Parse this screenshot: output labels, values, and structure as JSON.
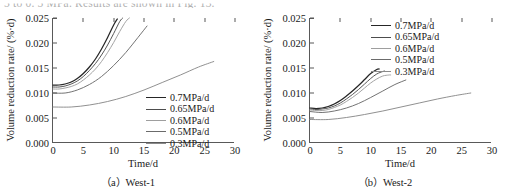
{
  "running_text": "5 to 0. 5 MPa.  Results are shown in Fig.  13.",
  "series_styles": {
    "0.7MPa/d": "#262626",
    "0.65MPa/d": "#4d4d4d",
    "0.6MPa/d": "#9e9e9e",
    "0.5MPa/d": "#6b6b6b",
    "0.3MPa/d": "#8a8a8a"
  },
  "figures": [
    {
      "id": "west-1",
      "caption": "（a）West-1",
      "xlabel": "Time/d",
      "ylabel": "Volume reduction rate/ (%·d)",
      "legend_position": "inside-lower-right"
    },
    {
      "id": "west-2",
      "caption": "（b）West-2",
      "xlabel": "Time/d",
      "ylabel": "Volume reduction rate/ (%·d)",
      "legend_position": "inside-upper-right"
    }
  ],
  "chart_data": [
    {
      "type": "line",
      "title": "（a）West-1",
      "xlabel": "Time/d",
      "ylabel": "Volume reduction rate/ (%·d)",
      "xlim": [
        0,
        30
      ],
      "ylim": [
        0.0,
        0.025
      ],
      "xticks": [
        0,
        5,
        10,
        15,
        20,
        25,
        30
      ],
      "yticks": [
        0.0,
        0.005,
        0.01,
        0.015,
        0.02,
        0.025
      ],
      "ytick_labels": [
        "0.000",
        "0.005",
        "0.010",
        "0.015",
        "0.020",
        "0.025"
      ],
      "xtick_labels": [
        "0",
        "5",
        "10",
        "15",
        "20",
        "25",
        "30"
      ],
      "grid": false,
      "legend_position": "lower right (inside)",
      "series": [
        {
          "name": "0.7MPa/d",
          "color": "#262626",
          "x": [
            0,
            1,
            2,
            3,
            4,
            5,
            6,
            7,
            8,
            9,
            10,
            10.6
          ],
          "y": [
            0.0116,
            0.0116,
            0.0118,
            0.0122,
            0.0129,
            0.0139,
            0.0152,
            0.0168,
            0.0188,
            0.0211,
            0.0236,
            0.0248
          ]
        },
        {
          "name": "0.65MPa/d",
          "color": "#4d4d4d",
          "x": [
            0,
            1,
            2,
            3,
            4,
            5,
            6,
            7,
            8,
            9,
            10,
            11,
            11.5
          ],
          "y": [
            0.0112,
            0.0112,
            0.0114,
            0.0118,
            0.0124,
            0.0133,
            0.0145,
            0.0159,
            0.0176,
            0.0196,
            0.0219,
            0.0243,
            0.025
          ]
        },
        {
          "name": "0.6MPa/d",
          "color": "#9e9e9e",
          "x": [
            0,
            1,
            2,
            3,
            4,
            5,
            6,
            7,
            8,
            9,
            10,
            11,
            12,
            12.6
          ],
          "y": [
            0.0108,
            0.0108,
            0.011,
            0.0113,
            0.0118,
            0.0126,
            0.0136,
            0.0148,
            0.0163,
            0.0181,
            0.0201,
            0.0223,
            0.0243,
            0.025
          ]
        },
        {
          "name": "0.5MPa/d",
          "color": "#6b6b6b",
          "x": [
            0,
            2,
            4,
            6,
            8,
            10,
            12,
            14,
            15.5
          ],
          "y": [
            0.01,
            0.01,
            0.0106,
            0.0117,
            0.0133,
            0.0155,
            0.0181,
            0.0211,
            0.0234
          ]
        },
        {
          "name": "0.3MPa/d",
          "color": "#8a8a8a",
          "x": [
            0,
            3,
            6,
            9,
            12,
            15,
            18,
            21,
            24,
            26.5
          ],
          "y": [
            0.0072,
            0.0072,
            0.0076,
            0.0083,
            0.0093,
            0.0106,
            0.0121,
            0.0136,
            0.0152,
            0.0163
          ]
        }
      ]
    },
    {
      "type": "line",
      "title": "（b）West-2",
      "xlabel": "Time/d",
      "ylabel": "Volume reduction rate/ (%·d)",
      "xlim": [
        0,
        30
      ],
      "ylim": [
        0.0,
        0.025
      ],
      "xticks": [
        0,
        5,
        10,
        15,
        20,
        25,
        30
      ],
      "yticks": [
        0.0,
        0.005,
        0.01,
        0.015,
        0.02,
        0.025
      ],
      "ytick_labels": [
        "0.000",
        "0.005",
        "0.010",
        "0.015",
        "0.020",
        "0.025"
      ],
      "xtick_labels": [
        "0",
        "5",
        "10",
        "15",
        "20",
        "25",
        "30"
      ],
      "grid": false,
      "legend_position": "upper right (inside)",
      "series": [
        {
          "name": "0.7MPa/d",
          "color": "#262626",
          "x": [
            0,
            1,
            2,
            3,
            4,
            5,
            6,
            7,
            8,
            9,
            10,
            11,
            11.4
          ],
          "y": [
            0.007,
            0.0069,
            0.007,
            0.0073,
            0.0078,
            0.0085,
            0.0094,
            0.0104,
            0.0115,
            0.0127,
            0.0139,
            0.0147,
            0.0148
          ]
        },
        {
          "name": "0.65MPa/d",
          "color": "#4d4d4d",
          "x": [
            0,
            1,
            2,
            3,
            4,
            5,
            6,
            7,
            8,
            9,
            10,
            11,
            12,
            12.3
          ],
          "y": [
            0.0068,
            0.0067,
            0.0068,
            0.007,
            0.0074,
            0.008,
            0.0088,
            0.0097,
            0.0107,
            0.0118,
            0.0129,
            0.0138,
            0.0143,
            0.0144
          ]
        },
        {
          "name": "0.6MPa/d",
          "color": "#9e9e9e",
          "x": [
            0,
            1,
            2,
            3,
            4,
            5,
            6,
            7,
            8,
            9,
            10,
            11,
            12,
            13,
            13.3
          ],
          "y": [
            0.0066,
            0.0065,
            0.0065,
            0.0067,
            0.0071,
            0.0076,
            0.0083,
            0.0091,
            0.01,
            0.011,
            0.012,
            0.0128,
            0.0134,
            0.0136,
            0.0136
          ]
        },
        {
          "name": "0.5MPa/d",
          "color": "#6b6b6b",
          "x": [
            0,
            2,
            4,
            6,
            8,
            10,
            12,
            14,
            15.8
          ],
          "y": [
            0.0063,
            0.0061,
            0.0064,
            0.007,
            0.0079,
            0.0091,
            0.0104,
            0.0117,
            0.0126
          ]
        },
        {
          "name": "0.3MPa/d",
          "color": "#8a8a8a",
          "x": [
            0,
            3,
            6,
            9,
            12,
            15,
            18,
            21,
            24,
            26.5
          ],
          "y": [
            0.0047,
            0.0047,
            0.0051,
            0.0057,
            0.0064,
            0.0072,
            0.008,
            0.0088,
            0.0095,
            0.01
          ]
        }
      ]
    }
  ]
}
